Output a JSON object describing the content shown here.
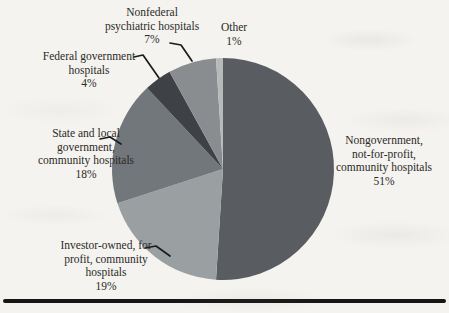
{
  "figure": {
    "background_color": "#f4f3ef",
    "rule_color": "#161616",
    "leader_line_color": "#1b1b1b",
    "text_color": "#2b2a27"
  },
  "chart_data": {
    "type": "pie",
    "start_angle_deg": 0,
    "direction": "clockwise",
    "title": "",
    "legend_position": "none",
    "slices": [
      {
        "label": "Nongovernment, not-for-profit, community hospitals",
        "value": 51,
        "percent_text": "51%",
        "color": "#595d61",
        "label_lines": [
          "Nongovernment,",
          "not-for-profit,",
          "community hospitals",
          "51%"
        ]
      },
      {
        "label": "Investor-owned, for profit, community hospitals",
        "value": 19,
        "percent_text": "19%",
        "color": "#9aa0a2",
        "label_lines": [
          "Investor-owned, for",
          "profit, community",
          "hospitals",
          "19%"
        ]
      },
      {
        "label": "State and local government, community hospitals",
        "value": 18,
        "percent_text": "18%",
        "color": "#72777b",
        "label_lines": [
          "State and local",
          "government,",
          "community hospitals",
          "18%"
        ]
      },
      {
        "label": "Federal government hospitals",
        "value": 4,
        "percent_text": "4%",
        "color": "#3e4246",
        "label_lines": [
          "Federal government",
          "hospitals",
          "4%"
        ]
      },
      {
        "label": "Nonfederal psychiatric hospitals",
        "value": 7,
        "percent_text": "7%",
        "color": "#898d90",
        "label_lines": [
          "Nonfederal",
          "psychiatric hospitals",
          "7%"
        ]
      },
      {
        "label": "Other",
        "value": 1,
        "percent_text": "1%",
        "color": "#b6bab9",
        "label_lines": [
          "Other",
          "1%"
        ]
      }
    ]
  }
}
